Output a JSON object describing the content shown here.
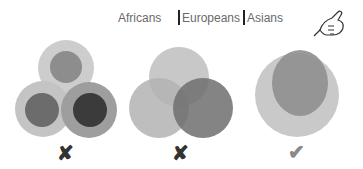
{
  "legend": {
    "items": [
      {
        "label": "Africans",
        "marker": false
      },
      {
        "label": "Europeans",
        "marker": true
      },
      {
        "label": "Asians",
        "marker": true
      }
    ]
  },
  "panels": [
    {
      "name": "separate-groups",
      "verdict": "wrong",
      "mark": "✘",
      "mark_color": "#333333"
    },
    {
      "name": "overlapping-groups",
      "verdict": "wrong",
      "mark": "✘",
      "mark_color": "#333333"
    },
    {
      "name": "nested-groups",
      "verdict": "correct",
      "mark": "✔",
      "mark_color": "#8a8a8a"
    }
  ],
  "colors": {
    "outer_light": "#c8c8c8",
    "mid": "#9a9a9a",
    "dark": "#6e6e6e",
    "darkest": "#3e3e3e"
  },
  "pointer_icon": "pointing-hand-icon"
}
